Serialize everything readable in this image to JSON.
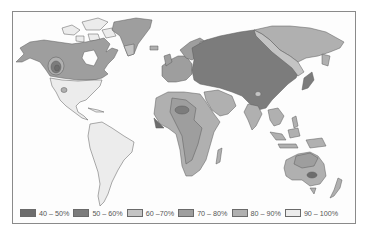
{
  "map": {
    "type": "choropleth-world",
    "colors": {
      "c40_50": "#6d6d6d",
      "c50_60": "#7c7c7c",
      "c60_70": "#c4c4c4",
      "c70_80": "#9e9e9e",
      "c80_90": "#b0b0b0",
      "c90_100": "#ececec",
      "outline": "#5a5a5a",
      "frame": "#8a8a8a"
    }
  },
  "legend": {
    "items": [
      {
        "label": "40 – 50%",
        "color": "#6d6d6d"
      },
      {
        "label": "50 – 60%",
        "color": "#7c7c7c"
      },
      {
        "label": "60 –70%",
        "color": "#c4c4c4"
      },
      {
        "label": "70 – 80%",
        "color": "#9e9e9e"
      },
      {
        "label": "80 – 90%",
        "color": "#b0b0b0"
      },
      {
        "label": "90 – 100%",
        "color": "#ececec"
      }
    ]
  }
}
